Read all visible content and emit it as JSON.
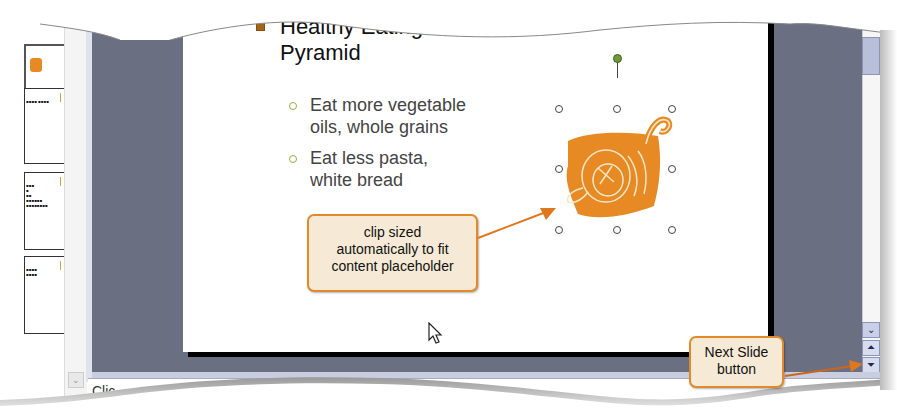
{
  "thumbnails": [
    {
      "index": 1,
      "has_clip": true,
      "lines": []
    },
    {
      "index": 2,
      "lines": [
        "▪▪▪▪ ▪▪▪▪"
      ]
    },
    {
      "index": 3,
      "lines": [
        "▪▪▪",
        "▪",
        "▪▪",
        "▪▪▪▪▪▪",
        "▪▪▪▪▪▪▪▪",
        "▪▪▪▪",
        "▪▪▪▪▪▪▪"
      ]
    },
    {
      "index": 4,
      "lines": [
        "▪▪▪▪",
        "▪▪▪▪"
      ]
    }
  ],
  "slide": {
    "title": "Healthy Eating Pyramid",
    "title_line1": "Healthy Eating",
    "title_line2": "Pyramid",
    "bullets": [
      {
        "line1": "Eat more vegetable",
        "line2": "oils, whole grains"
      },
      {
        "line1": "Eat less pasta,",
        "line2": "white bread"
      }
    ],
    "clip_art": "cornucopia-clip-art",
    "accent_color": "#e88a23",
    "title_bullet_color": "#a7651b",
    "sub_bullet_color": "#9aab3a"
  },
  "callouts": {
    "clip": {
      "line1": "clip sized",
      "line2": "automatically to fit",
      "line3": "content placeholder"
    },
    "next_slide": {
      "line1": "Next Slide",
      "line2": "button"
    }
  },
  "scrollbar": {
    "down_arrow": "⌄",
    "prev_slide": "⏶",
    "next_slide": "⏷"
  },
  "notes": {
    "placeholder": "Click to add notes",
    "visible_text": "Clic"
  },
  "colors": {
    "workspace": "#6b6f82",
    "callout_fill": "#f6ead6",
    "callout_border": "#e08a2a",
    "scroll_thumb": "#b8bfd9"
  }
}
